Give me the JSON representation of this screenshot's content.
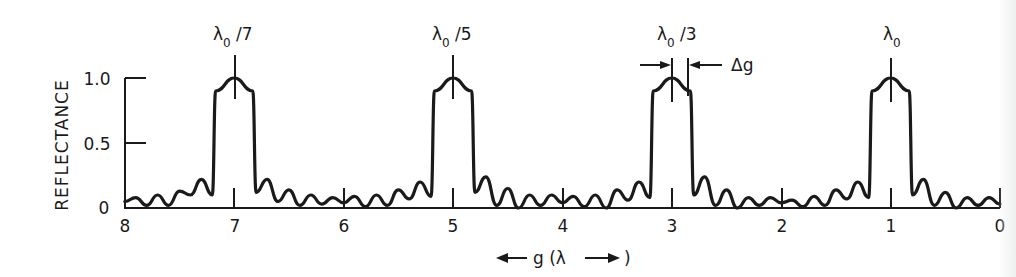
{
  "chart_data": {
    "type": "line",
    "title": "",
    "xlabel": "← g (λ →)",
    "ylabel": "REFLECTANCE",
    "xlim": [
      8,
      0
    ],
    "ylim": [
      0,
      1.0
    ],
    "x_ticks": [
      "8",
      "7",
      "6",
      "5",
      "4",
      "3",
      "2",
      "1",
      "0"
    ],
    "y_ticks": [
      "0",
      "0.5",
      "1.0"
    ],
    "grid": false,
    "legend": null,
    "annotations": [
      {
        "text": "λ0/7",
        "x": 7
      },
      {
        "text": "λ0/5",
        "x": 5
      },
      {
        "text": "λ0/3",
        "x": 3
      },
      {
        "text": "λ0",
        "x": 1
      },
      {
        "text": "Δg",
        "x": 2.75,
        "note": "bandwidth marker on λ0/3 peak"
      }
    ],
    "series": [
      {
        "name": "Reflectance",
        "peaks": [
          {
            "center": 7,
            "height": 1.0,
            "half_width": 0.17
          },
          {
            "center": 5,
            "height": 1.0,
            "half_width": 0.17
          },
          {
            "center": 3,
            "height": 1.0,
            "half_width": 0.17
          },
          {
            "center": 1,
            "height": 1.0,
            "half_width": 0.17
          }
        ],
        "x": [
          8.0,
          7.9,
          7.8,
          7.7,
          7.6,
          7.5,
          7.4,
          7.3,
          7.2,
          7.17,
          7.0,
          6.83,
          6.8,
          6.7,
          6.6,
          6.5,
          6.4,
          6.3,
          6.2,
          6.1,
          6.0,
          5.9,
          5.8,
          5.7,
          5.6,
          5.5,
          5.4,
          5.3,
          5.2,
          5.17,
          5.0,
          4.83,
          4.8,
          4.7,
          4.6,
          4.5,
          4.4,
          4.3,
          4.2,
          4.1,
          4.0,
          3.9,
          3.8,
          3.7,
          3.6,
          3.5,
          3.4,
          3.3,
          3.2,
          3.17,
          3.0,
          2.83,
          2.8,
          2.7,
          2.6,
          2.5,
          2.4,
          2.3,
          2.2,
          2.1,
          2.0,
          1.9,
          1.8,
          1.7,
          1.6,
          1.5,
          1.4,
          1.3,
          1.2,
          1.17,
          1.0,
          0.83,
          0.8,
          0.7,
          0.6,
          0.5,
          0.4,
          0.3,
          0.2,
          0.1,
          0.0
        ],
        "values": [
          0.05,
          0.08,
          0.02,
          0.1,
          0.02,
          0.13,
          0.1,
          0.22,
          0.1,
          0.9,
          1.0,
          0.9,
          0.12,
          0.22,
          0.05,
          0.14,
          0.02,
          0.1,
          0.03,
          0.08,
          0.04,
          0.09,
          0.01,
          0.1,
          0.02,
          0.14,
          0.07,
          0.2,
          0.09,
          0.9,
          1.0,
          0.9,
          0.12,
          0.24,
          0.02,
          0.15,
          0.0,
          0.1,
          0.02,
          0.1,
          0.04,
          0.09,
          0.01,
          0.1,
          0.0,
          0.14,
          0.06,
          0.2,
          0.08,
          0.9,
          1.0,
          0.9,
          0.1,
          0.24,
          0.02,
          0.14,
          0.0,
          0.08,
          0.02,
          0.08,
          0.04,
          0.06,
          0.01,
          0.09,
          0.02,
          0.14,
          0.07,
          0.2,
          0.08,
          0.9,
          1.0,
          0.9,
          0.1,
          0.22,
          0.02,
          0.12,
          0.0,
          0.08,
          0.02,
          0.08,
          0.03
        ]
      }
    ]
  },
  "labels": {
    "ylabel": "REFLECTANCE",
    "xlabel_left_arrow": "←",
    "xlabel_text": "g (λ",
    "xlabel_right": ")",
    "delta_g": "Δg",
    "lambda": "λ",
    "sub0": "0",
    "peak_labels": [
      "/7",
      "/5",
      "/3",
      ""
    ],
    "x_ticks": [
      "8",
      "7",
      "6",
      "5",
      "4",
      "3",
      "2",
      "1",
      "0"
    ],
    "y_ticks": [
      "0",
      "0.5",
      "1.0"
    ]
  },
  "colors": {
    "ink": "#1a1a1a",
    "background": "#ffffff"
  }
}
